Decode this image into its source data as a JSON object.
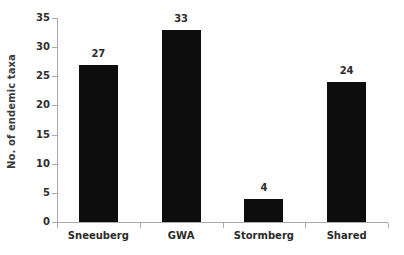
{
  "chart_data": {
    "type": "bar",
    "title": "",
    "xlabel": "",
    "ylabel": "No. of endemic taxa",
    "categories": [
      "Sneeuberg",
      "GWA",
      "Stormberg",
      "Shared"
    ],
    "values": [
      27,
      33,
      4,
      24
    ],
    "value_labels": [
      "27",
      "33",
      "4",
      "24"
    ],
    "ylim": [
      0,
      35
    ],
    "ytick_step": 5,
    "ytick_labels": [
      "0",
      "5",
      "10",
      "15",
      "20",
      "25",
      "30",
      "35"
    ],
    "ytick_values": [
      0,
      5,
      10,
      15,
      20,
      25,
      30,
      35
    ],
    "grid": false,
    "legend": false,
    "legend_position": "none",
    "bar_color": "#0d0d0d",
    "axis_color": "#a9a9a9",
    "text_color": "#2b2b2b",
    "background_color": "#ffffff"
  }
}
